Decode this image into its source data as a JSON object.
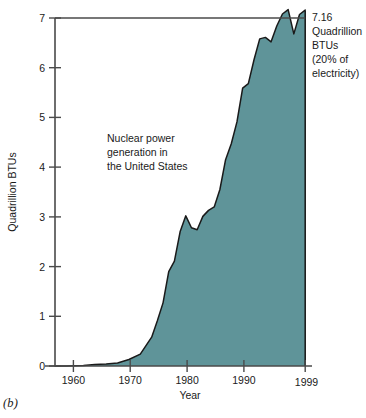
{
  "panel": {
    "caption": "(b)"
  },
  "chart_data": {
    "type": "area",
    "title": "",
    "subtitle": "",
    "xlabel": "Year",
    "ylabel": "Quadrillion BTUs",
    "xlim": [
      1955,
      1999
    ],
    "ylim": [
      0,
      7
    ],
    "grid": false,
    "legend_position": "none",
    "fill_color": "#5f9499",
    "line_color": "#1a1a1a",
    "axis_color": "#3a3a3a",
    "background_color": "#ffffff",
    "xticks": [
      1960,
      1970,
      1980,
      1990,
      1999
    ],
    "xtick_labels": [
      "1960",
      "1970",
      "1980",
      "1990",
      "1999"
    ],
    "yticks": [
      0,
      1,
      2,
      3,
      4,
      5,
      6,
      7
    ],
    "ytick_labels": [
      "0",
      "1",
      "2",
      "3",
      "4",
      "5",
      "6",
      "7"
    ],
    "series": [
      {
        "name": "Nuclear power generation in the United States",
        "x": [
          1955,
          1957,
          1960,
          1962,
          1964,
          1966,
          1968,
          1970,
          1971,
          1972,
          1973,
          1974,
          1975,
          1976,
          1977,
          1978,
          1979,
          1980,
          1981,
          1982,
          1983,
          1984,
          1985,
          1986,
          1987,
          1988,
          1989,
          1990,
          1991,
          1992,
          1993,
          1994,
          1995,
          1996,
          1997,
          1998,
          1999
        ],
        "y": [
          0.0,
          0.0,
          0.01,
          0.03,
          0.04,
          0.06,
          0.13,
          0.24,
          0.41,
          0.58,
          0.91,
          1.27,
          1.9,
          2.11,
          2.7,
          3.02,
          2.78,
          2.74,
          3.01,
          3.13,
          3.2,
          3.55,
          4.15,
          4.47,
          4.91,
          5.59,
          5.68,
          6.16,
          6.58,
          6.61,
          6.52,
          6.84,
          7.08,
          7.17,
          6.68,
          7.07,
          7.16
        ],
        "final_value": 7.16
      }
    ],
    "annotations": [
      {
        "name": "endpoint-callout",
        "lines": [
          "7.16",
          "Quadrillion",
          "BTUs",
          "(20% of",
          "electricity)"
        ],
        "target_year": 1999,
        "target_value": 7.16
      },
      {
        "name": "series-label",
        "lines": [
          "Nuclear power",
          "generation in",
          "the United States"
        ]
      }
    ]
  }
}
